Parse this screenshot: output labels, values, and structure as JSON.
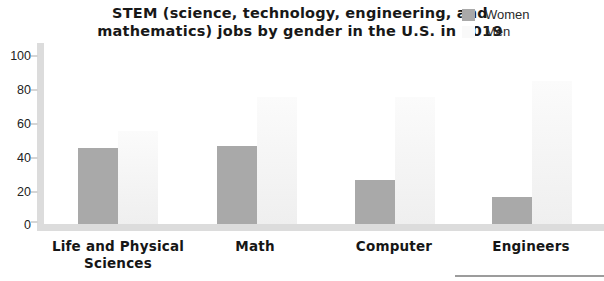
{
  "title": {
    "line1": "STEM (science, technology, engineering, and",
    "line2": "mathematics) jobs by gender in the U.S. in 2019"
  },
  "legend": {
    "items": [
      {
        "label": "Women",
        "color": "#a9a9a9"
      },
      {
        "label": "Men",
        "color": "#f9f9f9"
      }
    ]
  },
  "chart_data": {
    "type": "bar",
    "title": "STEM (science, technology, engineering, and mathematics) jobs by gender in the U.S. in 2019",
    "categories": [
      "Life and Physical Sciences",
      "Math",
      "Computer",
      "Engineers"
    ],
    "series": [
      {
        "name": "Women",
        "values": [
          45,
          46,
          26,
          16
        ],
        "color": "#a9a9a9"
      },
      {
        "name": "Men",
        "values": [
          55,
          75,
          75,
          84
        ],
        "color": "#f5f5f5"
      }
    ],
    "xlabel": "",
    "ylabel": "",
    "ylim": [
      0,
      100
    ],
    "yticks": [
      100,
      80,
      60,
      40,
      20,
      0
    ],
    "grid": false,
    "legend_position": "top-right"
  },
  "colors": {
    "axis": "#dcdcdc",
    "women_bar": "#a9a9a9",
    "men_bar_top": "#fbfbfb",
    "men_bar_bottom": "#efefef",
    "title_text": "#181818"
  }
}
